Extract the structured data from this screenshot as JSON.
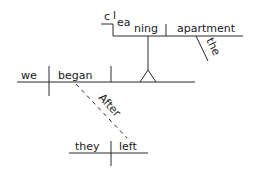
{
  "diagram": {
    "type": "sentence-diagram",
    "sentence": "After they left, we began cleaning the apartment.",
    "main_clause": {
      "subject": "we",
      "verb": "began",
      "direct_object": {
        "type": "gerund-phrase",
        "gerund_parts": [
          "c",
          "l",
          "ea",
          "ning"
        ],
        "gerund": "cleaning",
        "object": "apartment",
        "object_modifier": "the"
      }
    },
    "subordinate_clause": {
      "conjunction": "After",
      "subject": "they",
      "verb": "left"
    },
    "colors": {
      "line": "#2a2a2a",
      "text": "#1a1a1a",
      "background": "#ffffff"
    }
  }
}
